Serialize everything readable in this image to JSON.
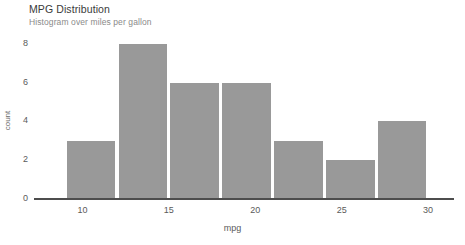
{
  "chart_data": {
    "type": "bar",
    "title": "MPG Distribution",
    "subtitle": "Histogram over miles per gallon",
    "xlabel": "mpg",
    "ylabel": "count",
    "xlim": [
      7.2,
      31.5
    ],
    "ylim": [
      0,
      8.5
    ],
    "xticks": [
      10,
      15,
      20,
      25,
      30
    ],
    "yticks": [
      0,
      2,
      4,
      6,
      8
    ],
    "grid": false,
    "legend": null,
    "bin_width": 3,
    "bin_edges": [
      9,
      12,
      15,
      18,
      21,
      24,
      27,
      30
    ],
    "categories": [
      "9-12",
      "12-15",
      "15-18",
      "18-21",
      "21-24",
      "24-27",
      "27-30"
    ],
    "bin_centers": [
      10.5,
      13.5,
      16.5,
      19.5,
      22.5,
      25.5,
      28.5
    ],
    "values": [
      3,
      8,
      6,
      6,
      3,
      2,
      4
    ],
    "bar_color": "#999999",
    "axis_color": "#4d4d4d",
    "title_color": "#3a3a3a",
    "subtitle_color": "#8a8a8a",
    "tick_label_color": "#5a5a5a",
    "background_color": "#ffffff"
  },
  "axis": {
    "x_tick_labels": [
      "10",
      "15",
      "20",
      "25",
      "30"
    ],
    "y_tick_labels": [
      "0",
      "2",
      "4",
      "6",
      "8"
    ]
  }
}
